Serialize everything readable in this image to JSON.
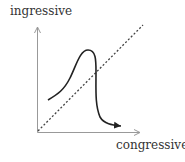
{
  "diagram": {
    "y_axis_label": "ingressive",
    "x_axis_label": "congressive",
    "elements": {
      "axes": "L-shaped axes with arrowheads (y up, x right)",
      "diagonal": "dotted diagonal line from origin to upper right",
      "curve": "solid curve rising to a peak above the diagonal then dropping sharply, ending with arrowhead pointing right near x-axis"
    },
    "colors": {
      "axis": "#999999",
      "curve": "#222222",
      "diagonal": "#444444",
      "text": "#333333"
    }
  }
}
